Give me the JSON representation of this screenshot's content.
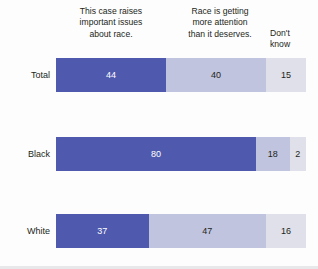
{
  "chart_data": {
    "type": "bar",
    "title": "",
    "subtitle": "",
    "xlabel": "",
    "ylabel": "",
    "orientation": "horizontal",
    "stacked": true,
    "grid": false,
    "legend_position": "top",
    "xlim": [
      0,
      100
    ],
    "categories": [
      "Total",
      "Black",
      "White"
    ],
    "series": [
      {
        "name": "This case raises important issues about race.",
        "color": "#4f5aae",
        "values": [
          44,
          80,
          37
        ]
      },
      {
        "name": "Race is getting more attention than it deserves.",
        "color": "#c0c4de",
        "values": [
          40,
          18,
          47
        ]
      },
      {
        "name": "Don't know",
        "color": "#dfe0e9",
        "values": [
          15,
          2,
          16
        ]
      }
    ]
  },
  "headers": [
    {
      "line1": "This case raises",
      "line2": "important issues",
      "line3": "about race."
    },
    {
      "line1": "Race is getting",
      "line2": "more attention",
      "line3": "than it deserves."
    },
    {
      "line1": "Don't",
      "line2": "know",
      "line3": ""
    }
  ],
  "header_text": [
    "This case raises important issues about race.",
    "Race is getting more attention than it deserves.",
    "Don't know"
  ],
  "rows": [
    {
      "label": "Total",
      "segments": [
        {
          "value": "44",
          "percent": 44
        },
        {
          "value": "40",
          "percent": 40
        },
        {
          "value": "15",
          "percent": 16
        }
      ]
    },
    {
      "label": "Black",
      "segments": [
        {
          "value": "80",
          "percent": 80
        },
        {
          "value": "18",
          "percent": 13.5
        },
        {
          "value": "2",
          "percent": 6.5
        }
      ]
    },
    {
      "label": "White",
      "segments": [
        {
          "value": "37",
          "percent": 37
        },
        {
          "value": "47",
          "percent": 47
        },
        {
          "value": "16",
          "percent": 16
        }
      ]
    }
  ],
  "colors": {
    "series_1": "#4f5aae",
    "series_2": "#c0c4de",
    "series_3": "#dfe0e9",
    "background": "#fdfdfd",
    "text": "#231f20",
    "value_light": "#ffffff"
  }
}
